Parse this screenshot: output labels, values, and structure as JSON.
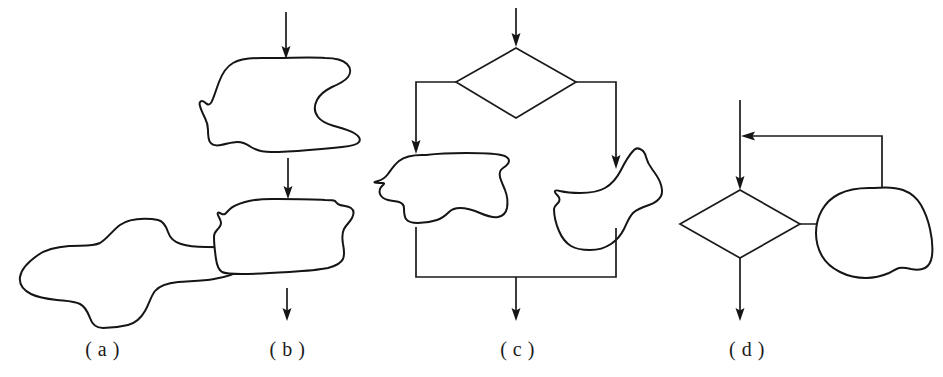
{
  "figure": {
    "background_color": "#ffffff",
    "ink_color": "#151515",
    "width": 943,
    "height": 377
  },
  "panels": [
    {
      "id": "a",
      "caption": "( a )",
      "structure": "single-process-block",
      "shapes": 1,
      "arrows": 0
    },
    {
      "id": "b",
      "caption": "( b )",
      "structure": "sequence",
      "shapes": 2,
      "arrows": 3
    },
    {
      "id": "c",
      "caption": "( c )",
      "structure": "selection-branch",
      "shapes": 3,
      "arrows": 4
    },
    {
      "id": "d",
      "caption": "( d )",
      "structure": "loop-repetition",
      "shapes": 2,
      "arrows": 4
    }
  ],
  "captions": {
    "a": "( a )",
    "b": "( b )",
    "c": "( c )",
    "d": "( d )"
  }
}
